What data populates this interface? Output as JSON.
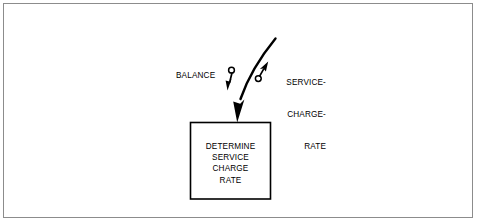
{
  "figure": {
    "type": "influence-diagram",
    "background_color": "#ffffff",
    "line_color": "#000000",
    "frame_color": "#8c8c8c"
  },
  "process_box": {
    "name": "determine-service-charge-rate",
    "lines": [
      "DETERMINE",
      "SERVICE",
      "CHARGE",
      "RATE"
    ]
  },
  "labels": {
    "balance": "BALANCE",
    "service_charge_rate": [
      "SERVICE-",
      "CHARGE-",
      "RATE"
    ]
  },
  "arrows": {
    "balance_arrow": "down-arrow-with-circle-tail",
    "service_charge_rate_arrow": "up-right-arrow-with-circle-tail",
    "main_flow_arrow": "curved-arrow-into-box"
  }
}
